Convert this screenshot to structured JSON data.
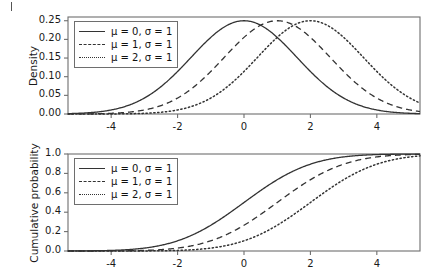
{
  "figure": {
    "panels": [
      {
        "id": "density",
        "legend": {
          "entries": [
            {
              "label": "μ = 0, σ = 1",
              "style": "solid"
            },
            {
              "label": "μ = 1, σ = 1",
              "style": "dashed"
            },
            {
              "label": "μ = 2, σ = 1",
              "style": "dotted"
            }
          ]
        }
      },
      {
        "id": "cumulative",
        "legend": {
          "entries": [
            {
              "label": "μ = 0, σ = 1",
              "style": "solid"
            },
            {
              "label": "μ = 1, σ = 1",
              "style": "dashed"
            },
            {
              "label": "μ = 2, σ = 1",
              "style": "dotted"
            }
          ]
        }
      }
    ]
  },
  "chart_data": [
    {
      "type": "line",
      "id": "density",
      "title": "",
      "xlabel": "",
      "ylabel": "Density",
      "xlim": [
        -5.3,
        5.3
      ],
      "ylim": [
        0.0,
        0.26
      ],
      "xticks": [
        -4,
        -2,
        0,
        2,
        4
      ],
      "xticklabels": [
        "-4",
        "-2",
        "0",
        "2",
        "4"
      ],
      "yticks": [
        0.0,
        0.05,
        0.1,
        0.15,
        0.2,
        0.25
      ],
      "yticklabels": [
        "0.00",
        "0.05",
        "0.10",
        "0.15",
        "0.20",
        "0.25"
      ],
      "grid": false,
      "legend_position": "top-left",
      "distribution": "normal-pdf",
      "scale": 1.5958,
      "series": [
        {
          "name": "μ = 0, σ = 1",
          "style": "solid",
          "mean": 0,
          "peak": 0.25,
          "peak_x": 0
        },
        {
          "name": "μ = 1, σ = 1",
          "style": "dashed",
          "mean": 1,
          "peak": 0.25,
          "peak_x": 1
        },
        {
          "name": "μ = 2, σ = 1",
          "style": "dotted",
          "mean": 2,
          "peak": 0.25,
          "peak_x": 2
        }
      ]
    },
    {
      "type": "line",
      "id": "cumulative",
      "title": "",
      "xlabel": "",
      "ylabel": "Cumulative probability",
      "xlim": [
        -5.3,
        5.3
      ],
      "ylim": [
        0.0,
        1.0
      ],
      "xticks": [
        -4,
        -2,
        0,
        2,
        4
      ],
      "xticklabels": [
        "-4",
        "-2",
        "0",
        "2",
        "4"
      ],
      "yticks": [
        0.0,
        0.2,
        0.4,
        0.6,
        0.8,
        1.0
      ],
      "yticklabels": [
        "0.0",
        "0.2",
        "0.4",
        "0.6",
        "0.8",
        "1.0"
      ],
      "grid": false,
      "legend_position": "top-left",
      "distribution": "normal-cdf",
      "scale": 1.5958,
      "series": [
        {
          "name": "μ = 0, σ = 1",
          "style": "solid",
          "mean": 0,
          "median_x": 0
        },
        {
          "name": "μ = 1, σ = 1",
          "style": "dashed",
          "mean": 1,
          "median_x": 1
        },
        {
          "name": "μ = 2, σ = 1",
          "style": "dotted",
          "mean": 2,
          "median_x": 2
        }
      ]
    }
  ]
}
